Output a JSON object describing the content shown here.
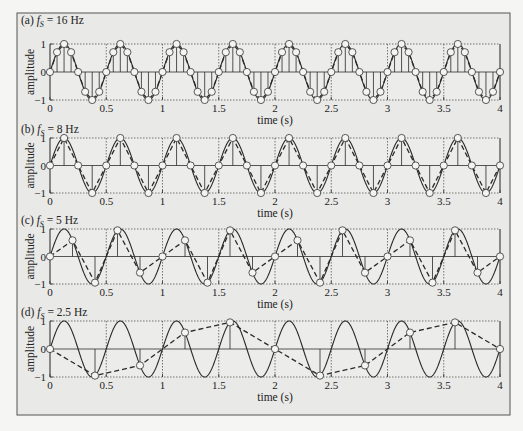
{
  "colors": {
    "page_bg": "#f5f5f4",
    "frame_bg": "#e9e9e7",
    "plot_bg": "#ececea",
    "frame_border": "#555555",
    "axis": "#444444",
    "signal": "#2a2a2a",
    "marker_fill": "#f4f4f4",
    "grid": "#555555"
  },
  "chart_data": [
    {
      "type": "line",
      "panel": "a",
      "title": "(a) f_S = 16 Hz",
      "title_prefix": "(a) ",
      "title_f": "f",
      "title_sub": "S",
      "title_suffix": " = 16 Hz",
      "xlabel": "time (s)",
      "ylabel": "amplitude",
      "xlim": [
        0,
        4
      ],
      "ylim": [
        -1,
        1
      ],
      "xticks": [
        0,
        0.5,
        1,
        1.5,
        2,
        2.5,
        3,
        3.5,
        4
      ],
      "xtick_labels": [
        "0",
        "0.5",
        "1",
        "1.5",
        "2",
        "2.5",
        "3",
        "3.5",
        "4"
      ],
      "yticks": [
        -1,
        0,
        1
      ],
      "ytick_labels": [
        "−1",
        "0",
        "1"
      ],
      "grid": "dotted vertical at 0.5 s intervals, dotted horizontal at ±1",
      "signal": {
        "name": "continuous sine",
        "frequency_hz": 2,
        "amplitude": 1,
        "style": "solid"
      },
      "sampling_rate_hz": 16,
      "samples": {
        "name": "sampled values",
        "style": "stems + circles + dashed reconstruction",
        "t_step": 0.0625,
        "values_first_period": [
          0,
          0.707,
          1,
          0.707,
          0,
          -0.707,
          -1,
          -0.707
        ]
      }
    },
    {
      "type": "line",
      "panel": "b",
      "title": "(b) f_S = 8 Hz",
      "title_prefix": "(b) ",
      "title_f": "f",
      "title_sub": "S",
      "title_suffix": " = 8 Hz",
      "xlabel": "time (s)",
      "ylabel": "amplitude",
      "xlim": [
        0,
        4
      ],
      "ylim": [
        -1,
        1
      ],
      "xticks": [
        0,
        0.5,
        1,
        1.5,
        2,
        2.5,
        3,
        3.5,
        4
      ],
      "xtick_labels": [
        "0",
        "0.5",
        "1",
        "1.5",
        "2",
        "2.5",
        "3",
        "3.5",
        "4"
      ],
      "yticks": [
        -1,
        0,
        1
      ],
      "ytick_labels": [
        "−1",
        "0",
        "1"
      ],
      "signal": {
        "name": "continuous sine",
        "frequency_hz": 2,
        "amplitude": 1,
        "style": "solid"
      },
      "sampling_rate_hz": 8,
      "samples": {
        "t_step": 0.125,
        "values_first_period": [
          0,
          1,
          0,
          -1
        ]
      }
    },
    {
      "type": "line",
      "panel": "c",
      "title": "(c) f_S = 5 Hz",
      "title_prefix": "(c) ",
      "title_f": "f",
      "title_sub": "S",
      "title_suffix": " = 5 Hz",
      "xlabel": "time (s)",
      "ylabel": "amplitude",
      "xlim": [
        0,
        4
      ],
      "ylim": [
        -1,
        1
      ],
      "xticks": [
        0,
        0.5,
        1,
        1.5,
        2,
        2.5,
        3,
        3.5,
        4
      ],
      "xtick_labels": [
        "0",
        "0.5",
        "1",
        "1.5",
        "2",
        "2.5",
        "3",
        "3.5",
        "4"
      ],
      "yticks": [
        -1,
        0,
        1
      ],
      "ytick_labels": [
        "−1",
        "0",
        "1"
      ],
      "signal": {
        "name": "continuous sine",
        "frequency_hz": 2,
        "amplitude": 1,
        "style": "solid"
      },
      "sampling_rate_hz": 5,
      "samples": {
        "t_step": 0.2,
        "values_first_period": [
          0,
          0.588,
          -0.951,
          0.951,
          -0.588
        ]
      }
    },
    {
      "type": "line",
      "panel": "d",
      "title": "(d) f_S = 2.5 Hz",
      "title_prefix": "(d) ",
      "title_f": "f",
      "title_sub": "S",
      "title_suffix": " = 2.5 Hz",
      "xlabel": "time (s)",
      "ylabel": "amplitude",
      "xlim": [
        0,
        4
      ],
      "ylim": [
        -1,
        1
      ],
      "xticks": [
        0,
        0.5,
        1,
        1.5,
        2,
        2.5,
        3,
        3.5,
        4
      ],
      "xtick_labels": [
        "0",
        "0.5",
        "1",
        "1.5",
        "2",
        "2.5",
        "3",
        "3.5",
        "4"
      ],
      "yticks": [
        -1,
        0,
        1
      ],
      "ytick_labels": [
        "−1",
        "0",
        "1"
      ],
      "signal": {
        "name": "continuous sine",
        "frequency_hz": 2,
        "amplitude": 1,
        "style": "solid"
      },
      "sampling_rate_hz": 2.5,
      "samples": {
        "t_step": 0.4,
        "values_first_period": [
          0,
          -0.951,
          -0.588,
          0.588,
          0.951
        ]
      }
    }
  ],
  "layout": {
    "frame": {
      "x": 17,
      "y": 13,
      "w": 493,
      "h": 402
    },
    "plot_x0": 50,
    "plot_x1": 500,
    "panels": [
      {
        "title_y": 24,
        "top": 44,
        "bottom": 100,
        "ticklabel_y": 112,
        "xlabel_y": 124,
        "show_xlabel": true
      },
      {
        "title_y": 133,
        "top": 138,
        "bottom": 193,
        "ticklabel_y": 205,
        "xlabel_y": 217,
        "show_xlabel": true
      },
      {
        "title_y": 224,
        "top": 229,
        "bottom": 284,
        "ticklabel_y": 296,
        "xlabel_y": 308,
        "show_xlabel": true
      },
      {
        "title_y": 316,
        "top": 321,
        "bottom": 377,
        "ticklabel_y": 389,
        "xlabel_y": 401,
        "show_xlabel": true
      }
    ]
  }
}
